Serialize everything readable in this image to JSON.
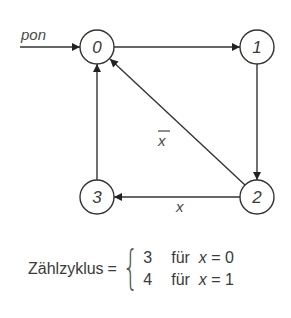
{
  "diagram": {
    "type": "state-transition-diagram",
    "input_label": "pon",
    "states": [
      {
        "id": "0",
        "label": "0",
        "cx": 97,
        "cy": 47
      },
      {
        "id": "1",
        "label": "1",
        "cx": 257,
        "cy": 47
      },
      {
        "id": "2",
        "label": "2",
        "cx": 257,
        "cy": 197
      },
      {
        "id": "3",
        "label": "3",
        "cx": 97,
        "cy": 197
      }
    ],
    "transitions": [
      {
        "from": "pon",
        "to": "0",
        "label": "pon"
      },
      {
        "from": "0",
        "to": "1",
        "label": ""
      },
      {
        "from": "1",
        "to": "2",
        "label": ""
      },
      {
        "from": "2",
        "to": "0",
        "label": "x̄"
      },
      {
        "from": "2",
        "to": "3",
        "label": "x"
      },
      {
        "from": "3",
        "to": "0",
        "label": ""
      }
    ],
    "edge_labels": {
      "x_bar": "x",
      "x": "x"
    }
  },
  "formula": {
    "lhs": "Zählzyklus",
    "equals": "=",
    "cases": [
      {
        "value": "3",
        "word": "für",
        "var": "x",
        "rel": "= 0"
      },
      {
        "value": "4",
        "word": "für",
        "var": "x",
        "rel": "= 1"
      }
    ]
  }
}
